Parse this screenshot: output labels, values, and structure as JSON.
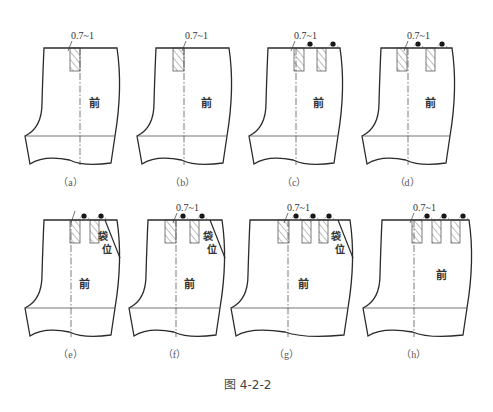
{
  "figure": {
    "caption": "图 4-2-2",
    "front_label": "前",
    "pocket_label_1": "袋",
    "pocket_label_2": "位",
    "dimension_label": "0.7~1"
  },
  "panels": [
    {
      "id": "a",
      "caption": "（a）",
      "x": 44,
      "y": 48,
      "w": 73,
      "darts": [
        {
          "x": 70,
          "w": 10
        }
      ],
      "center": 80,
      "dots": [],
      "pocket": false,
      "dimLabelX": 71
    },
    {
      "id": "b",
      "caption": "（b）",
      "x": 156,
      "y": 48,
      "w": 73,
      "darts": [
        {
          "x": 173,
          "w": 11
        }
      ],
      "center": 184,
      "dots": [],
      "pocket": false,
      "dimLabelX": 185
    },
    {
      "id": "c",
      "caption": "（c）",
      "x": 268,
      "y": 48,
      "w": 72,
      "darts": [
        {
          "x": 294,
          "w": 10
        },
        {
          "x": 317,
          "w": 9
        }
      ],
      "center": 296,
      "dots": [
        310,
        333
      ],
      "pocket": false,
      "dimLabelX": 294
    },
    {
      "id": "d",
      "caption": "（d）",
      "x": 381,
      "y": 48,
      "w": 71,
      "darts": [
        {
          "x": 397,
          "w": 10
        },
        {
          "x": 426,
          "w": 9
        }
      ],
      "center": 408,
      "dots": [
        418,
        442
      ],
      "pocket": false,
      "dimLabelX": 407
    },
    {
      "id": "e",
      "caption": "（e）",
      "x": 44,
      "y": 220,
      "w": 73,
      "darts": [
        {
          "x": 70,
          "w": 10
        },
        {
          "x": 90,
          "w": 9
        }
      ],
      "center": 71,
      "dots": [
        84,
        101
      ],
      "pocket": true,
      "dimLabelX": null
    },
    {
      "id": "f",
      "caption": "（f）",
      "x": 148,
      "y": 220,
      "w": 74,
      "darts": [
        {
          "x": 165,
          "w": 11
        },
        {
          "x": 190,
          "w": 9
        }
      ],
      "center": 176,
      "dots": [
        183,
        202
      ],
      "pocket": true,
      "dimLabelX": 176
    },
    {
      "id": "g",
      "caption": "（g）",
      "x": 250,
      "y": 220,
      "w": 100,
      "darts": [
        {
          "x": 278,
          "w": 11
        },
        {
          "x": 302,
          "w": 9
        },
        {
          "x": 319,
          "w": 9
        }
      ],
      "center": 288,
      "dots": [
        296,
        313,
        329
      ],
      "pocket": true,
      "dimLabelX": 287
    },
    {
      "id": "h",
      "caption": "（h）",
      "x": 382,
      "y": 220,
      "w": 87,
      "darts": [
        {
          "x": 412,
          "w": 10
        },
        {
          "x": 432,
          "w": 9
        },
        {
          "x": 451,
          "w": 9
        }
      ],
      "center": 414,
      "dots": [
        427,
        444,
        463
      ],
      "pocket": false,
      "dimLabelX": 413
    }
  ]
}
